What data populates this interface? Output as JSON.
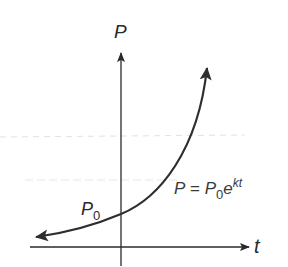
{
  "diagram": {
    "title": "",
    "type": "exponential-growth-graph",
    "axes": {
      "vertical_label": "P",
      "horizontal_label": "t"
    },
    "intercept": {
      "label_main": "P",
      "label_sub": "0"
    },
    "equation": {
      "lhs": "P",
      "equals": " = ",
      "coef_main": "P",
      "coef_sub": "0",
      "base": "e",
      "exponent": "kt"
    },
    "colors": {
      "axis": "#2a2a2a",
      "curve": "#2e2e2e",
      "text": "#2a2a2a",
      "scan_line": "#d8d8d8",
      "background": "#ffffff"
    }
  }
}
